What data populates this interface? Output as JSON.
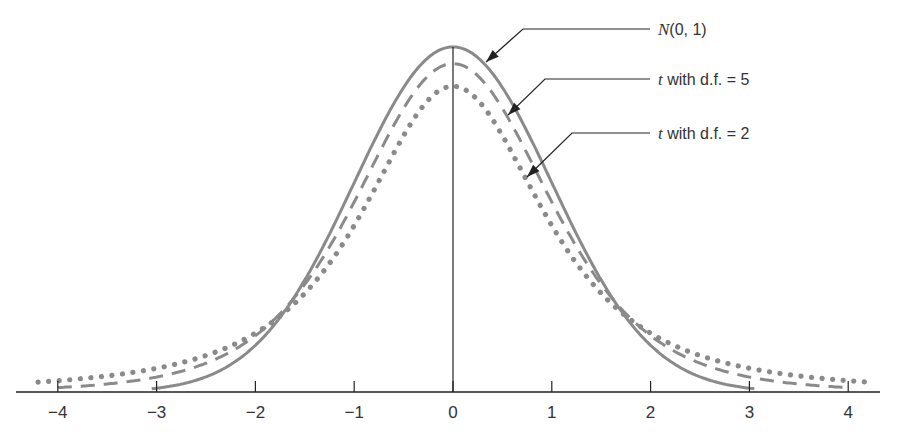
{
  "chart_data": {
    "type": "line",
    "title": "",
    "xlabel": "",
    "ylabel": "",
    "xlim": [
      -4.3,
      4.3
    ],
    "ylim": [
      0,
      0.42
    ],
    "grid": false,
    "x_ticks": [
      -4,
      -3,
      -2,
      -1,
      0,
      1,
      2,
      3,
      4
    ],
    "x_tick_labels": [
      "−4",
      "−3",
      "−2",
      "−1",
      "0",
      "1",
      "2",
      "3",
      "4"
    ],
    "series": [
      {
        "name": "N(0, 1)",
        "style": "solid",
        "x_range": [
          -3.05,
          3.05
        ],
        "peak": 0.399
      },
      {
        "name": "t with d.f. = 5",
        "style": "dashed",
        "x_range": [
          -4.0,
          3.95
        ],
        "peak": 0.38
      },
      {
        "name": "t with d.f. = 2",
        "style": "dotted",
        "x_range": [
          -4.2,
          4.2
        ],
        "peak": 0.354
      }
    ],
    "annotations": [
      {
        "label_prefix": "N",
        "label_rest": "(0, 1)",
        "target_series": "N(0, 1)"
      },
      {
        "label_prefix": "t",
        "label_rest": " with d.f. = 5",
        "target_series": "t with d.f. = 5"
      },
      {
        "label_prefix": "t",
        "label_rest": " with d.f. = 2",
        "target_series": "t with d.f. = 2"
      }
    ],
    "colors": {
      "curves": "#8a8a8a",
      "axis": "#222222",
      "text": "#333333"
    }
  }
}
